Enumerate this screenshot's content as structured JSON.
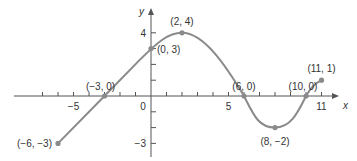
{
  "chart_data": {
    "type": "line",
    "title": "",
    "xlabel": "x",
    "ylabel": "y",
    "xlim": [
      -7.5,
      12
    ],
    "ylim": [
      -4,
      5.5
    ],
    "grid": false,
    "legend": null,
    "x_ticks": [
      -7,
      -6,
      -5,
      -4,
      -3,
      -2,
      -1,
      0,
      1,
      2,
      3,
      4,
      5,
      6,
      7,
      8,
      9,
      10,
      11
    ],
    "x_tick_labels": [
      {
        "value": -5,
        "label": "−5"
      },
      {
        "value": 0,
        "label": "0"
      },
      {
        "value": 5,
        "label": "5"
      },
      {
        "value": 11,
        "label": "11"
      }
    ],
    "y_ticks": [
      -3,
      -2,
      -1,
      1,
      2,
      3,
      4
    ],
    "y_tick_labels": [
      {
        "value": 4,
        "label": "4"
      },
      {
        "value": -3,
        "label": "−3"
      }
    ],
    "series": [
      {
        "name": "f",
        "color": "#8a8a8a",
        "points": [
          {
            "x": -6,
            "y": -3,
            "label": "(−6, −3)",
            "marker": true
          },
          {
            "x": -3,
            "y": 0,
            "label": "(−3, 0)",
            "marker": true
          },
          {
            "x": 0,
            "y": 3,
            "label": "(0, 3)",
            "marker": true
          },
          {
            "x": 2,
            "y": 4,
            "label": "(2, 4)",
            "marker": true
          },
          {
            "x": 6,
            "y": 0,
            "label": "(6, 0)",
            "marker": true
          },
          {
            "x": 8,
            "y": -2,
            "label": "(8, −2)",
            "marker": true
          },
          {
            "x": 10,
            "y": 0,
            "label": "(10, 0)",
            "marker": true
          },
          {
            "x": 11,
            "y": 1,
            "label": "(11, 1)",
            "marker": true
          }
        ]
      }
    ]
  },
  "colors": {
    "axis": "#555555",
    "curve": "#8a8a8a",
    "marker": "#8a8a8a",
    "text": "#333333"
  }
}
